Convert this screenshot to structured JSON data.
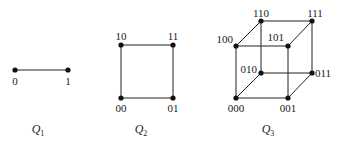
{
  "graphs": [
    {
      "name": "Q1",
      "caption": {
        "letter": "Q",
        "sub": "1"
      },
      "vertices": [
        {
          "label": "0",
          "x": 15,
          "y": 70,
          "lx": 15,
          "ly": 85,
          "anchor": "middle"
        },
        {
          "label": "1",
          "x": 68,
          "y": 70,
          "lx": 68,
          "ly": 85,
          "anchor": "middle"
        }
      ],
      "edges": [
        [
          0,
          1
        ]
      ],
      "caption_pos": {
        "x": 38,
        "y": 133
      }
    },
    {
      "name": "Q2",
      "caption": {
        "letter": "Q",
        "sub": "2"
      },
      "vertices": [
        {
          "label": "10",
          "x": 121,
          "y": 45,
          "lx": 121,
          "ly": 40,
          "anchor": "middle"
        },
        {
          "label": "11",
          "x": 173,
          "y": 45,
          "lx": 173,
          "ly": 40,
          "anchor": "middle"
        },
        {
          "label": "00",
          "x": 121,
          "y": 98,
          "lx": 121,
          "ly": 112,
          "anchor": "middle"
        },
        {
          "label": "01",
          "x": 173,
          "y": 98,
          "lx": 173,
          "ly": 112,
          "anchor": "middle"
        }
      ],
      "edges": [
        [
          0,
          1
        ],
        [
          0,
          2
        ],
        [
          1,
          3
        ],
        [
          2,
          3
        ]
      ],
      "caption_pos": {
        "x": 141,
        "y": 133
      }
    },
    {
      "name": "Q3",
      "caption": {
        "letter": "Q",
        "sub": "3"
      },
      "vertices": [
        {
          "label": "110",
          "x": 261,
          "y": 21,
          "lx": 261,
          "ly": 17,
          "anchor": "middle"
        },
        {
          "label": "111",
          "x": 312,
          "y": 21,
          "lx": 315,
          "ly": 17,
          "anchor": "middle"
        },
        {
          "label": "100",
          "x": 236,
          "y": 46,
          "lx": 233,
          "ly": 43,
          "anchor": "end"
        },
        {
          "label": "101",
          "x": 288,
          "y": 46,
          "lx": 284,
          "ly": 41,
          "anchor": "end"
        },
        {
          "label": "010",
          "x": 261,
          "y": 73,
          "lx": 257,
          "ly": 73,
          "anchor": "end"
        },
        {
          "label": "011",
          "x": 312,
          "y": 73,
          "lx": 315,
          "ly": 77,
          "anchor": "start"
        },
        {
          "label": "000",
          "x": 236,
          "y": 98,
          "lx": 236,
          "ly": 112,
          "anchor": "middle"
        },
        {
          "label": "001",
          "x": 288,
          "y": 98,
          "lx": 288,
          "ly": 112,
          "anchor": "middle"
        }
      ],
      "edges": [
        [
          0,
          1
        ],
        [
          0,
          2
        ],
        [
          1,
          3
        ],
        [
          2,
          3
        ],
        [
          4,
          5
        ],
        [
          4,
          6
        ],
        [
          5,
          7
        ],
        [
          6,
          7
        ],
        [
          0,
          4
        ],
        [
          1,
          5
        ],
        [
          2,
          6
        ],
        [
          3,
          7
        ]
      ],
      "caption_pos": {
        "x": 268,
        "y": 133
      }
    }
  ]
}
